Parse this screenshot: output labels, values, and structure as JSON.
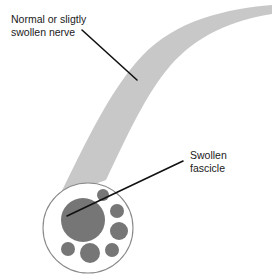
{
  "figure": {
    "background_color": "#ffffff"
  },
  "annotations": {
    "nerve": {
      "line1": "Normal or sligtly",
      "line2": "swollen nerve",
      "text_color": "#1a1a1a",
      "leader": {
        "x1": 82,
        "y1": 30,
        "x2": 137,
        "y2": 80
      }
    },
    "fascicle": {
      "line1": "Swollen",
      "line2": "fascicle",
      "text_color": "#1a1a1a",
      "leader": {
        "x1": 183,
        "y1": 161,
        "x2": 67,
        "y2": 216
      }
    }
  },
  "chart_data": {
    "type": "diagram",
    "nerve_band": {
      "label": "Normal or sligtly swollen nerve",
      "fill": "#c8c8c8",
      "description": "Curved tapering band running from lower-left cross-section up and to the right off-frame"
    },
    "cross_section": {
      "label": "Nerve cross-section (epineurium)",
      "center": [
        88,
        228
      ],
      "radius": 45,
      "fill": "#ffffff",
      "stroke": "#8a8a8a",
      "stroke_width": 1
    },
    "fascicles": [
      {
        "name": "swollen-fascicle",
        "cx": 83,
        "cy": 220,
        "r": 22,
        "fill": "#767676",
        "swollen": true
      },
      {
        "name": "fascicle-top",
        "cx": 103,
        "cy": 195,
        "r": 6,
        "fill": "#767676",
        "swollen": false
      },
      {
        "name": "fascicle-upper-right",
        "cx": 117,
        "cy": 211,
        "r": 7,
        "fill": "#767676",
        "swollen": false
      },
      {
        "name": "fascicle-right",
        "cx": 119,
        "cy": 231,
        "r": 9,
        "fill": "#767676",
        "swollen": false
      },
      {
        "name": "fascicle-lower-right",
        "cx": 112,
        "cy": 250,
        "r": 7,
        "fill": "#767676",
        "swollen": false
      },
      {
        "name": "fascicle-bottom",
        "cx": 90,
        "cy": 253,
        "r": 10,
        "fill": "#767676",
        "swollen": false
      },
      {
        "name": "fascicle-bottom-left",
        "cx": 68,
        "cy": 249,
        "r": 7,
        "fill": "#767676",
        "swollen": false
      }
    ],
    "legend": [],
    "colors": {
      "nerve_fill": "#c8c8c8",
      "fascicle_fill": "#767676",
      "outline": "#8a8a8a",
      "leader_line": "#111111",
      "text": "#1a1a1a"
    }
  }
}
